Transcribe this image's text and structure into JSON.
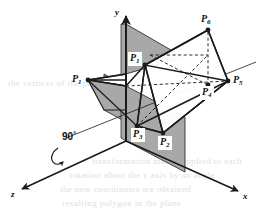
{
  "figure": {
    "colors": {
      "plane_fill": "#a8a8a8",
      "stroke": "#1a1a1a",
      "background": "#ffffff",
      "label_box": "#ffffff",
      "bleed_text": "#e2e0dd"
    },
    "axes": [
      {
        "name": "y-axis",
        "label": "y",
        "direction": "up"
      },
      {
        "name": "x-axis",
        "label": "x",
        "direction": "down-right"
      },
      {
        "name": "z-axis",
        "label": "z",
        "direction": "down-left"
      }
    ],
    "annotation": {
      "rotation_angle": "90",
      "degree_symbol": "°",
      "about_axis": "z"
    },
    "points": [
      {
        "id": "P1-left",
        "label": "P",
        "sub": "1",
        "x": 88,
        "y": 80,
        "boxed": false
      },
      {
        "id": "P1-upper",
        "label": "P",
        "sub": "1",
        "x": 145,
        "y": 65,
        "boxed": true
      },
      {
        "id": "P2",
        "label": "P",
        "sub": "2",
        "x": 163,
        "y": 133,
        "boxed": true
      },
      {
        "id": "P3",
        "label": "P",
        "sub": "3",
        "x": 137,
        "y": 126,
        "boxed": true
      },
      {
        "id": "P4",
        "label": "P",
        "sub": "4",
        "x": 208,
        "y": 85,
        "boxed": true
      },
      {
        "id": "P5",
        "label": "P",
        "sub": "5",
        "x": 230,
        "y": 81,
        "boxed": false
      },
      {
        "id": "P6",
        "label": "P",
        "sub": "6",
        "x": 208,
        "y": 30,
        "boxed": false
      }
    ],
    "bleed_lines": [
      {
        "text": "the vertices of the polygon",
        "x": 8,
        "y": 78,
        "w": 120
      },
      {
        "text": "transformation matrix applied to each",
        "x": 92,
        "y": 156,
        "w": 165
      },
      {
        "text": "rotation about the z axis by an angle",
        "x": 70,
        "y": 170,
        "w": 190
      },
      {
        "text": "the new coordinates are obtained",
        "x": 60,
        "y": 184,
        "w": 200
      },
      {
        "text": "resulting polygon in the plane",
        "x": 62,
        "y": 198,
        "w": 196
      }
    ]
  }
}
